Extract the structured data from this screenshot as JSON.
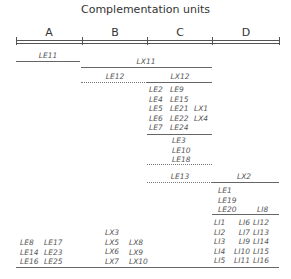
{
  "title": "Complementation units",
  "columns": [
    "A",
    "B",
    "C",
    "D"
  ],
  "segments": {
    "LE11": "LE11",
    "LX11": "LX11",
    "LE12": "LE12",
    "LX12": "LX12",
    "LE13": "LE13",
    "LX2": "LX2",
    "LI8": "LI8"
  },
  "groups": {
    "c_block1": {
      "col1": [
        "LE2",
        "LE4",
        "LE5",
        "LE6",
        "LE7"
      ],
      "col2": [
        "LE9",
        "LE15",
        "LE21",
        "LE22",
        "LE24"
      ],
      "col3": [
        "LX1",
        "LX4"
      ]
    },
    "c_block2": [
      "LE3",
      "LE10",
      "LE18"
    ],
    "d_block1": [
      "LE1",
      "LE19",
      "LE20"
    ],
    "d_block2": {
      "col1": [
        "LI1",
        "LI2",
        "LI3",
        "LI4",
        "LI5"
      ],
      "col2": [
        "LI6",
        "LI7",
        "LI9",
        "LI10",
        "LI11"
      ],
      "col3": [
        "LI12",
        "LI13",
        "LI14",
        "LI15",
        "LI16"
      ]
    },
    "a_block": {
      "col1": [
        "LE8",
        "LE14",
        "LE16"
      ],
      "col2": [
        "LE17",
        "LE23",
        "LE25"
      ]
    },
    "b_block": {
      "col1": [
        "LX3",
        "LX5",
        "LX6",
        "LX7"
      ],
      "col2": [
        "LX8",
        "LX9",
        "LX10"
      ]
    }
  }
}
